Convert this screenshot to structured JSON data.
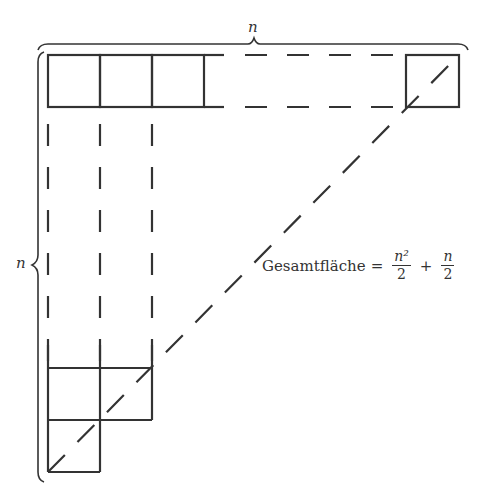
{
  "diagram": {
    "top_brace_label": "n",
    "left_brace_label": "n",
    "formula": {
      "text": "Gesamtfläche",
      "equals": "=",
      "term1_num": "n²",
      "term1_den": "2",
      "plus": "+",
      "term2_num": "n",
      "term2_den": "2"
    },
    "stroke_color": "#333333",
    "square_size_px": 52,
    "top_row_solid_squares": 3,
    "bottom_rows": [
      2,
      1
    ]
  }
}
